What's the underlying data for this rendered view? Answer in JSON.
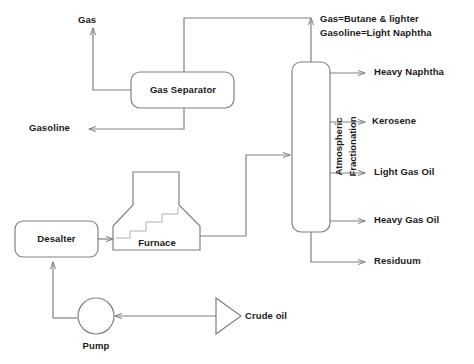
{
  "diagram": {
    "line_color": "#808080",
    "text_color": "#1a1a1a",
    "background": "#ffffff"
  },
  "nodes": {
    "gas_separator": {
      "label": "Gas Separator",
      "shape": "rounded-rectangle"
    },
    "atmospheric_column": {
      "line1": "Atmospheric",
      "line2": "Fractionation",
      "shape": "rounded-rectangle-vertical"
    },
    "furnace": {
      "label": "Furnace",
      "shape": "flask"
    },
    "desalter": {
      "label": "Desalter",
      "shape": "rounded-rectangle"
    },
    "pump": {
      "label": "Pump",
      "shape": "circle"
    },
    "crude_oil": {
      "label": "Crude oil",
      "shape": "triangle"
    }
  },
  "streams": {
    "gas": "Gas",
    "gasoline": "Gasoline",
    "heavy_naphtha": "Heavy Naphtha",
    "kerosene": "Kerosene",
    "light_gas_oil": "Light Gas Oil",
    "heavy_gas_oil": "Heavy Gas Oil",
    "residuum": "Residuum"
  },
  "notes": {
    "line1": "Gas=Butane & lighter",
    "line2": "Gasoline=Light Naphtha"
  }
}
